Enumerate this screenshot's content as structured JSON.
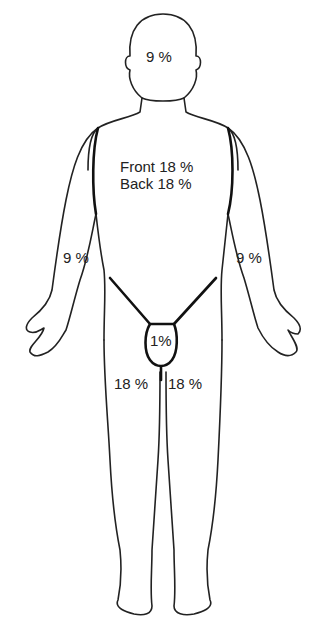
{
  "figure": {
    "type": "rule-of-nines body surface diagram",
    "view": "anterior",
    "line_color": "#222222",
    "background": "#ffffff"
  },
  "regions": {
    "head": {
      "label": "9 %"
    },
    "trunk_front": {
      "label": "Front 18 %"
    },
    "trunk_back": {
      "label": "Back 18 %"
    },
    "right_arm": {
      "label": "9 %"
    },
    "left_arm": {
      "label": "9 %"
    },
    "perineum": {
      "label": "1%"
    },
    "right_leg": {
      "label": "18 %"
    },
    "left_leg": {
      "label": "18 %"
    }
  }
}
